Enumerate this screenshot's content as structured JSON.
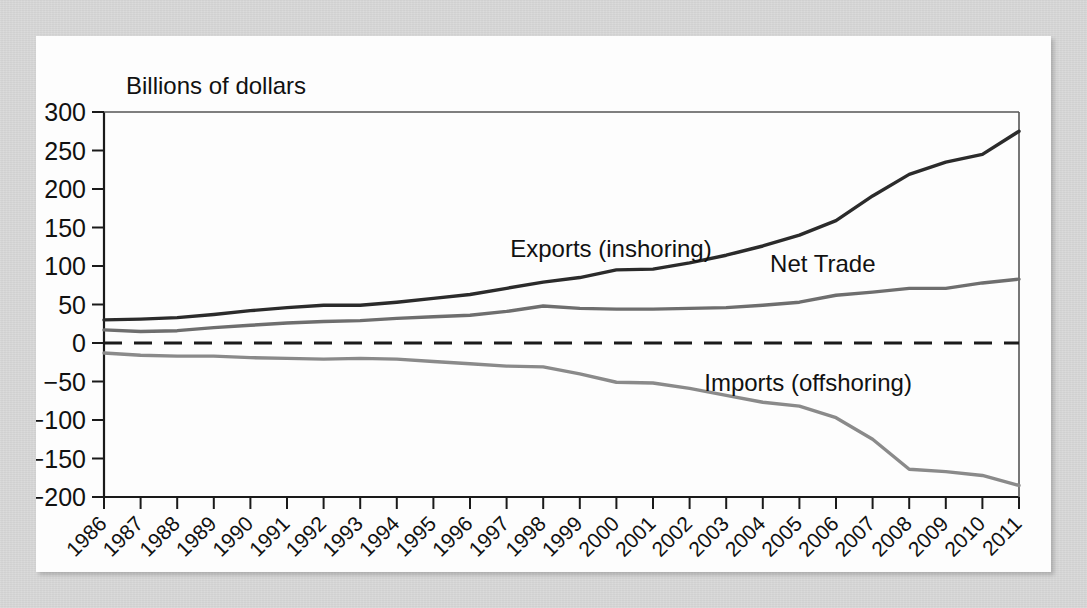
{
  "figure": {
    "y_axis_title": "Billions of dollars",
    "background_color": "#d5d5d5",
    "panel_color": "#fdfdfd"
  },
  "chart_data": {
    "type": "line",
    "title": "",
    "xlabel": "",
    "ylabel": "Billions of dollars",
    "ylim": [
      -200,
      300
    ],
    "xlim": [
      1986,
      2011
    ],
    "yticks": [
      300,
      250,
      200,
      150,
      100,
      50,
      0,
      -50,
      -100,
      -150,
      -200
    ],
    "ytick_labels": [
      "300",
      "250",
      "200",
      "150",
      "100",
      "50",
      "0",
      "−50",
      "−100",
      "−150",
      "−200"
    ],
    "grid": false,
    "legend": "inline-annotations",
    "zero_line": {
      "value": 0,
      "style": "dashed",
      "color": "#1a1a1a"
    },
    "categories": [
      1986,
      1987,
      1988,
      1989,
      1990,
      1991,
      1992,
      1993,
      1994,
      1995,
      1996,
      1997,
      1998,
      1999,
      2000,
      2001,
      2002,
      2003,
      2004,
      2005,
      2006,
      2007,
      2008,
      2009,
      2010,
      2011
    ],
    "x": [
      "1986",
      "1987",
      "1988",
      "1989",
      "1990",
      "1991",
      "1992",
      "1993",
      "1994",
      "1995",
      "1996",
      "1997",
      "1998",
      "1999",
      "2000",
      "2001",
      "2002",
      "2003",
      "2004",
      "2005",
      "2006",
      "2007",
      "2008",
      "2009",
      "2010",
      "2011"
    ],
    "series": [
      {
        "name": "Exports (inshoring)",
        "color": "#2b2b2b",
        "width": 3.4,
        "label_x": 1997.1,
        "label_y": 112,
        "values": [
          30,
          31,
          33,
          37,
          42,
          46,
          49,
          49,
          53,
          58,
          63,
          71,
          79,
          85,
          95,
          96,
          104,
          114,
          126,
          140,
          159,
          191,
          219,
          235,
          245,
          275
        ]
      },
      {
        "name": "Net Trade",
        "color": "#6e6e6e",
        "width": 3.4,
        "label_x": 2004.2,
        "label_y": 92,
        "values": [
          17,
          15,
          16,
          20,
          23,
          26,
          28,
          29,
          32,
          34,
          36,
          41,
          48,
          45,
          44,
          44,
          45,
          46,
          49,
          53,
          62,
          66,
          71,
          71,
          78,
          83
        ]
      },
      {
        "name": "Imports (offshoring)",
        "color": "#8a8a8a",
        "width": 3.4,
        "label_x": 2002.4,
        "label_y": -62,
        "values": [
          -13,
          -16,
          -17,
          -17,
          -19,
          -20,
          -21,
          -20,
          -21,
          -24,
          -27,
          -30,
          -31,
          -40,
          -51,
          -52,
          -59,
          -68,
          -77,
          -82,
          -97,
          -125,
          -164,
          -167,
          -172,
          -185
        ]
      }
    ]
  }
}
